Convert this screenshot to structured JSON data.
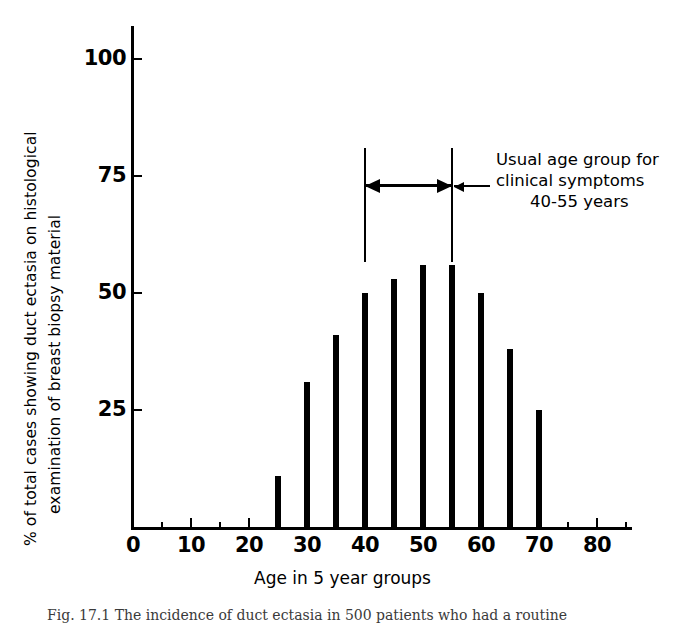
{
  "chart_data": {
    "type": "bar",
    "title": "",
    "xlabel": "Age in 5 year groups",
    "ylabel_line1": "% of total cases showing duct ectasia on histological",
    "ylabel_line2": "examination of breast biopsy material",
    "categories": [
      0,
      5,
      10,
      15,
      20,
      25,
      30,
      35,
      40,
      45,
      50,
      55,
      60,
      65,
      70,
      75,
      80
    ],
    "values": [
      0,
      0,
      0,
      0,
      0,
      11,
      31,
      41,
      50,
      53,
      56,
      56,
      50,
      38,
      25,
      0,
      0
    ],
    "xlim": [
      0,
      86
    ],
    "ylim": [
      0,
      104
    ],
    "x_major_ticks": [
      0,
      10,
      20,
      30,
      40,
      50,
      60,
      70,
      80
    ],
    "x_major_tick_labels": [
      "0",
      "10",
      "20",
      "30",
      "40",
      "50",
      "60",
      "70",
      "80"
    ],
    "x_minor_ticks": [
      5,
      15,
      25,
      35,
      45,
      55,
      65,
      75,
      85
    ],
    "y_ticks": [
      25,
      50,
      75,
      100
    ],
    "y_tick_labels": [
      "25",
      "50",
      "75",
      "100"
    ],
    "grid": false,
    "legend": null,
    "bar_color": "#000000",
    "annotations": [
      {
        "name": "usual-age-group-bracket",
        "line1": "Usual age group for",
        "line2": "clinical symptoms",
        "line3": "40-55 years",
        "range_start": 40,
        "range_end": 55
      }
    ]
  },
  "axes": {
    "y_label_line1": "% of total cases showing duct ectasia on histological",
    "y_label_line2": "examination of breast biopsy material",
    "x_title": "Age in 5 year groups",
    "y_ticks": [
      {
        "value": 100,
        "label": "100"
      },
      {
        "value": 75,
        "label": "75"
      },
      {
        "value": 50,
        "label": "50"
      },
      {
        "value": 25,
        "label": "25"
      }
    ],
    "x_ticks": [
      {
        "value": 0,
        "label": "0"
      },
      {
        "value": 10,
        "label": "10"
      },
      {
        "value": 20,
        "label": "20"
      },
      {
        "value": 30,
        "label": "30"
      },
      {
        "value": 40,
        "label": "40"
      },
      {
        "value": 50,
        "label": "50"
      },
      {
        "value": 60,
        "label": "60"
      },
      {
        "value": 70,
        "label": "70"
      },
      {
        "value": 80,
        "label": "80"
      }
    ]
  },
  "annotation": {
    "line1": "Usual age group for",
    "line2": "clinical symptoms",
    "line3": "40-55 years"
  },
  "caption": {
    "text": "Fig. 17.1   The incidence of duct ectasia in 500 patients who had a routine"
  }
}
